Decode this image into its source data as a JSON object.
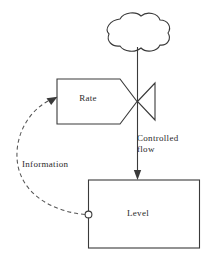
{
  "diagram": {
    "type": "stock-and-flow",
    "title": "",
    "background_color": "#ffffff",
    "line_color": "#3a3a3a",
    "text_color": "#2b2b2b",
    "nodes": {
      "source_cloud": {
        "label": "",
        "icon": "cloud-icon",
        "role": "source"
      },
      "valve": {
        "label": "",
        "icon": "valve-icon",
        "role": "flow-regulator"
      },
      "rate": {
        "label": "Rate",
        "shape": "pentagon-arrow",
        "role": "rate-variable"
      },
      "level": {
        "label": "Level",
        "shape": "rectangle",
        "role": "stock"
      },
      "level_connector": {
        "label": "",
        "icon": "circle-connector-icon",
        "role": "information-take-off"
      }
    },
    "edges": {
      "controlled_flow": {
        "label": "Controlled\nflow",
        "label_line_1": "Controlled",
        "label_line_2": "flow",
        "style": "solid",
        "arrow": "down",
        "from": "valve",
        "to": "level"
      },
      "information": {
        "label": "Information",
        "style": "dashed",
        "arrow": "up-right",
        "from": "level_connector",
        "to": "rate"
      },
      "source_pipe": {
        "label": "",
        "style": "solid",
        "from": "source_cloud",
        "to": "valve"
      },
      "rate_to_valve": {
        "label": "",
        "style": "solid",
        "from": "rate",
        "to": "valve"
      }
    }
  }
}
